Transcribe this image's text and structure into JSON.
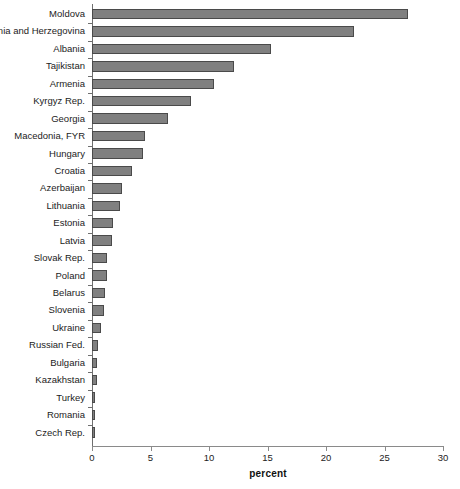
{
  "chart_data": {
    "type": "bar",
    "orientation": "horizontal",
    "title": "",
    "xlabel": "percent",
    "ylabel": "",
    "xlim": [
      0,
      30
    ],
    "xticks": [
      0,
      5,
      10,
      15,
      20,
      25,
      30
    ],
    "xtick_labels": [
      "0",
      "5",
      "10",
      "15",
      "20",
      "25",
      "30"
    ],
    "grid": false,
    "legend": null,
    "bar_color": "#808080",
    "bar_edge_color": "#4a4a4a",
    "axis_color": "#6f6f6f",
    "categories": [
      "Moldova",
      "Bosnia and Herzegovina",
      "Albania",
      "Tajikistan",
      "Armenia",
      "Kyrgyz Rep.",
      "Georgia",
      "Macedonia, FYR",
      "Hungary",
      "Croatia",
      "Azerbaijan",
      "Lithuania",
      "Estonia",
      "Latvia",
      "Slovak Rep.",
      "Poland",
      "Belarus",
      "Slovenia",
      "Ukraine",
      "Russian Fed.",
      "Bulgaria",
      "Kazakhstan",
      "Turkey",
      "Romania",
      "Czech Rep."
    ],
    "values": [
      27.0,
      22.4,
      15.3,
      12.1,
      10.4,
      8.5,
      6.5,
      4.5,
      4.4,
      3.4,
      2.6,
      2.4,
      1.8,
      1.7,
      1.3,
      1.3,
      1.1,
      1.0,
      0.8,
      0.5,
      0.45,
      0.45,
      0.25,
      0.2,
      0.15
    ]
  }
}
